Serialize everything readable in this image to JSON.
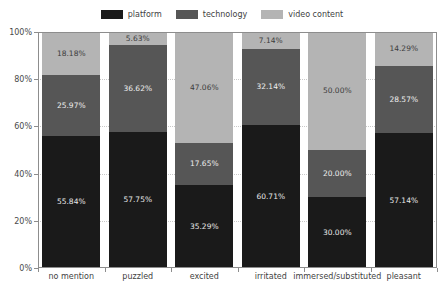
{
  "chart_data": {
    "type": "bar",
    "stacked": true,
    "normalized": true,
    "title": "",
    "xlabel": "",
    "ylabel": "",
    "ylim": [
      0,
      100
    ],
    "ytick_labels": [
      "0%",
      "20%",
      "40%",
      "60%",
      "80%",
      "100%"
    ],
    "ytick_values": [
      0,
      20,
      40,
      60,
      80,
      100
    ],
    "grid": true,
    "legend_position": "top-center",
    "categories": [
      "no mention",
      "puzzled",
      "excited",
      "irritated",
      "immersed/substituted",
      "pleasant"
    ],
    "series": [
      {
        "name": "platform",
        "color": "#1a1a1a",
        "values": [
          55.84,
          57.75,
          35.29,
          60.71,
          30.0,
          57.14
        ],
        "labels": [
          "55.84%",
          "57.75%",
          "35.29%",
          "60.71%",
          "30.00%",
          "57.14%"
        ]
      },
      {
        "name": "technology",
        "color": "#565656",
        "values": [
          25.97,
          36.62,
          17.65,
          32.14,
          20.0,
          28.57
        ],
        "labels": [
          "25.97%",
          "36.62%",
          "17.65%",
          "32.14%",
          "20.00%",
          "28.57%"
        ]
      },
      {
        "name": "video content",
        "color": "#b4b4b4",
        "values": [
          18.18,
          5.63,
          47.06,
          7.14,
          50.0,
          14.29
        ],
        "labels": [
          "18.18%",
          "5.63%",
          "47.06%",
          "7.14%",
          "50.00%",
          "14.29%"
        ]
      }
    ]
  }
}
